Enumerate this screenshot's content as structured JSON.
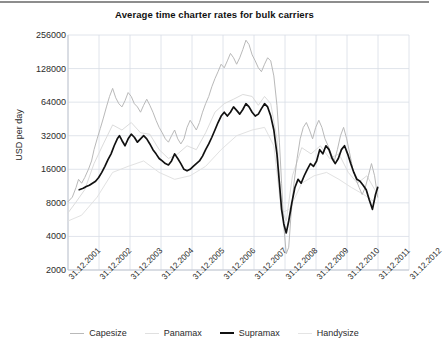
{
  "chart_data": {
    "type": "line",
    "title": "Average time charter rates for bulk carriers",
    "xlabel": "",
    "ylabel": "USD per day",
    "yscale": "log",
    "ylim": [
      2000,
      256000
    ],
    "yticks": [
      2000,
      4000,
      8000,
      16000,
      32000,
      64000,
      128000,
      256000
    ],
    "ytick_labels": [
      "2000",
      "4000",
      "8000",
      "16000",
      "32000",
      "64000",
      "128000",
      "256000"
    ],
    "xticks": [
      "31.12.2001",
      "31.12.2002",
      "31.12.2003",
      "31.12.2004",
      "31.12.2005",
      "31.12.2006",
      "31.12.2007",
      "31.12.2008",
      "31.12.2009",
      "31.12.2010",
      "31.12.2011",
      "31.12.2012"
    ],
    "xlim": [
      "31.12.2001",
      "31.12.2012"
    ],
    "grid": true,
    "legend_position": "bottom",
    "colors": {
      "capesize": "#b9b9b9",
      "panamax": "#dcdcdc",
      "supramax": "#111111",
      "handysize": "#e2e2e2",
      "grid": "#d8dde6",
      "axis": "#c4c9d2",
      "text": "#2b2b2b",
      "rule": "#8d8d8d"
    },
    "series": [
      {
        "name": "Capesize",
        "color": "#b9b9b9",
        "width": 1,
        "x": [
          2001.96,
          2002.1,
          2002.22,
          2002.3,
          2002.4,
          2002.5,
          2002.62,
          2002.72,
          2002.8,
          2002.9,
          2003.0,
          2003.1,
          2003.2,
          2003.3,
          2003.4,
          2003.5,
          2003.6,
          2003.7,
          2003.8,
          2003.9,
          2004.0,
          2004.1,
          2004.2,
          2004.3,
          2004.4,
          2004.5,
          2004.6,
          2004.7,
          2004.8,
          2004.9,
          2005.0,
          2005.1,
          2005.2,
          2005.3,
          2005.4,
          2005.5,
          2005.6,
          2005.7,
          2005.8,
          2005.9,
          2006.0,
          2006.1,
          2006.2,
          2006.3,
          2006.4,
          2006.5,
          2006.6,
          2006.7,
          2006.8,
          2006.9,
          2007.0,
          2007.1,
          2007.2,
          2007.3,
          2007.4,
          2007.5,
          2007.6,
          2007.7,
          2007.8,
          2007.9,
          2008.0,
          2008.1,
          2008.2,
          2008.3,
          2008.4,
          2008.5,
          2008.6,
          2008.7,
          2008.78,
          2008.85,
          2008.92,
          2009.0,
          2009.08,
          2009.15,
          2009.25,
          2009.35,
          2009.45,
          2009.55,
          2009.65,
          2009.75,
          2009.85,
          2009.95,
          2010.05,
          2010.15,
          2010.25,
          2010.35,
          2010.45,
          2010.55,
          2010.65,
          2010.75,
          2010.85,
          2010.95,
          2011.05,
          2011.15,
          2011.25,
          2011.35,
          2011.45,
          2011.55,
          2011.65,
          2011.75,
          2011.85,
          2011.95
        ],
        "y": [
          8200,
          9000,
          11000,
          13000,
          12000,
          13500,
          16000,
          19000,
          24000,
          30000,
          37000,
          46000,
          58000,
          72000,
          85000,
          70000,
          62000,
          58000,
          66000,
          78000,
          72000,
          62000,
          58000,
          52000,
          60000,
          68000,
          60000,
          52000,
          44000,
          38000,
          34000,
          30000,
          28000,
          32000,
          36000,
          30000,
          27000,
          30000,
          38000,
          44000,
          40000,
          36000,
          42000,
          52000,
          62000,
          72000,
          88000,
          104000,
          120000,
          140000,
          130000,
          150000,
          175000,
          160000,
          140000,
          160000,
          190000,
          230000,
          210000,
          170000,
          150000,
          130000,
          120000,
          140000,
          160000,
          150000,
          110000,
          60000,
          28000,
          12000,
          5000,
          2800,
          3200,
          6000,
          12000,
          20000,
          30000,
          38000,
          42000,
          36000,
          30000,
          38000,
          44000,
          38000,
          30000,
          26000,
          22000,
          19000,
          24000,
          32000,
          38000,
          30000,
          22000,
          16000,
          13000,
          11000,
          9500,
          11000,
          14000,
          18000,
          14000,
          9000
        ]
      },
      {
        "name": "Panamax",
        "color": "#dcdcdc",
        "width": 1,
        "x": [
          2001.96,
          2002.2,
          2002.5,
          2002.8,
          2003.1,
          2003.4,
          2003.7,
          2004.0,
          2004.3,
          2004.6,
          2004.9,
          2005.2,
          2005.5,
          2005.8,
          2006.1,
          2006.4,
          2006.7,
          2007.0,
          2007.3,
          2007.6,
          2007.9,
          2008.1,
          2008.3,
          2008.5,
          2008.7,
          2008.85,
          2009.0,
          2009.2,
          2009.5,
          2009.8,
          2010.1,
          2010.4,
          2010.7,
          2011.0,
          2011.3,
          2011.6,
          2011.9
        ],
        "y": [
          6500,
          8000,
          10500,
          18000,
          27000,
          40000,
          36000,
          42000,
          34000,
          33000,
          24000,
          20000,
          22000,
          26000,
          24000,
          34000,
          52000,
          62000,
          68000,
          75000,
          72000,
          60000,
          72000,
          62000,
          30000,
          7000,
          5500,
          14000,
          25000,
          22000,
          26000,
          20000,
          22000,
          15000,
          12000,
          14000,
          10000
        ]
      },
      {
        "name": "Supramax",
        "color": "#111111",
        "width": 1.7,
        "x": [
          2002.32,
          2002.45,
          2002.55,
          2002.65,
          2002.75,
          2002.85,
          2002.95,
          2003.05,
          2003.15,
          2003.25,
          2003.35,
          2003.45,
          2003.55,
          2003.62,
          2003.7,
          2003.8,
          2003.9,
          2004.0,
          2004.1,
          2004.2,
          2004.3,
          2004.4,
          2004.5,
          2004.6,
          2004.7,
          2004.8,
          2004.9,
          2005.0,
          2005.1,
          2005.2,
          2005.3,
          2005.4,
          2005.5,
          2005.6,
          2005.7,
          2005.8,
          2005.9,
          2006.0,
          2006.1,
          2006.2,
          2006.3,
          2006.4,
          2006.5,
          2006.6,
          2006.7,
          2006.8,
          2006.9,
          2007.0,
          2007.1,
          2007.2,
          2007.3,
          2007.4,
          2007.5,
          2007.6,
          2007.7,
          2007.8,
          2007.9,
          2008.0,
          2008.1,
          2008.2,
          2008.3,
          2008.4,
          2008.5,
          2008.6,
          2008.7,
          2008.78,
          2008.85,
          2008.92,
          2009.0,
          2009.08,
          2009.18,
          2009.28,
          2009.38,
          2009.48,
          2009.58,
          2009.68,
          2009.78,
          2009.88,
          2009.98,
          2010.08,
          2010.18,
          2010.28,
          2010.38,
          2010.48,
          2010.58,
          2010.68,
          2010.78,
          2010.88,
          2010.98,
          2011.08,
          2011.18,
          2011.28,
          2011.38,
          2011.48,
          2011.58,
          2011.68,
          2011.78,
          2011.88,
          2011.95
        ],
        "y": [
          10500,
          10800,
          11200,
          11500,
          12000,
          12500,
          13500,
          15000,
          17000,
          19500,
          22000,
          26000,
          30000,
          32000,
          29000,
          26000,
          30000,
          33000,
          31000,
          28000,
          30000,
          32000,
          30000,
          27000,
          24000,
          22000,
          20000,
          19000,
          18000,
          17500,
          19000,
          22000,
          20000,
          18000,
          16000,
          15500,
          16000,
          17000,
          18000,
          19000,
          21000,
          24000,
          27000,
          31000,
          36000,
          42000,
          48000,
          52000,
          48000,
          52000,
          58000,
          54000,
          50000,
          55000,
          62000,
          58000,
          52000,
          48000,
          50000,
          56000,
          62000,
          58000,
          48000,
          36000,
          22000,
          12000,
          7000,
          5200,
          4300,
          5500,
          8000,
          11000,
          13000,
          12000,
          14000,
          16000,
          18000,
          17000,
          19000,
          24000,
          22000,
          26000,
          24000,
          20000,
          18000,
          20000,
          24000,
          26000,
          22000,
          18000,
          15000,
          13000,
          12500,
          11500,
          10500,
          8500,
          7000,
          9500,
          11000
        ]
      },
      {
        "name": "Handysize",
        "color": "#e2e2e2",
        "width": 1,
        "x": [
          2001.96,
          2002.4,
          2002.9,
          2003.4,
          2003.9,
          2004.4,
          2004.9,
          2005.4,
          2005.9,
          2006.4,
          2006.9,
          2007.4,
          2007.9,
          2008.3,
          2008.6,
          2008.85,
          2009.1,
          2009.5,
          2009.9,
          2010.3,
          2010.7,
          2011.1,
          2011.5,
          2011.9
        ],
        "y": [
          5500,
          6200,
          9000,
          15000,
          17000,
          19000,
          15000,
          13000,
          14000,
          17000,
          24000,
          32000,
          36000,
          38000,
          26000,
          6500,
          7000,
          12000,
          14000,
          15000,
          13000,
          11000,
          9500,
          8000
        ]
      }
    ]
  },
  "legend": {
    "items": [
      {
        "label": "Capesize",
        "color": "#b9b9b9",
        "width": "1px"
      },
      {
        "label": "Panamax",
        "color": "#e0e0e0",
        "width": "1px"
      },
      {
        "label": "Supramax",
        "color": "#111111",
        "width": "2px"
      },
      {
        "label": "Handysize",
        "color": "#e4e4e4",
        "width": "1px"
      }
    ]
  }
}
